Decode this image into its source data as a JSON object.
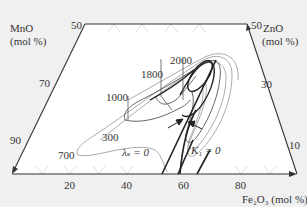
{
  "diagram": {
    "type": "ternary-phase-diagram",
    "colors": {
      "background": "#f0f0f0",
      "plot_area": "#ffffff",
      "axis": "#333333",
      "contour_dark": "#222222",
      "contour_mid": "#666666",
      "contour_light": "#aaaaaa"
    },
    "axes": {
      "mno": {
        "title_line1": "MnO",
        "title_line2": "(mol %)",
        "ticks": [
          "50",
          "70",
          "90"
        ]
      },
      "zno": {
        "title_line1": "ZnO",
        "title_line2": "(mol %)",
        "ticks": [
          "50",
          "30",
          "10"
        ]
      },
      "fe2o3": {
        "title": "Fe₂O₃ (mol %)",
        "ticks": [
          "20",
          "40",
          "60",
          "80"
        ]
      }
    },
    "contours": {
      "labels": [
        "2000",
        "1800",
        "1000",
        "300",
        "700"
      ],
      "lambda_s": "λₛ = 0",
      "k1": "K₁ = 0"
    }
  }
}
